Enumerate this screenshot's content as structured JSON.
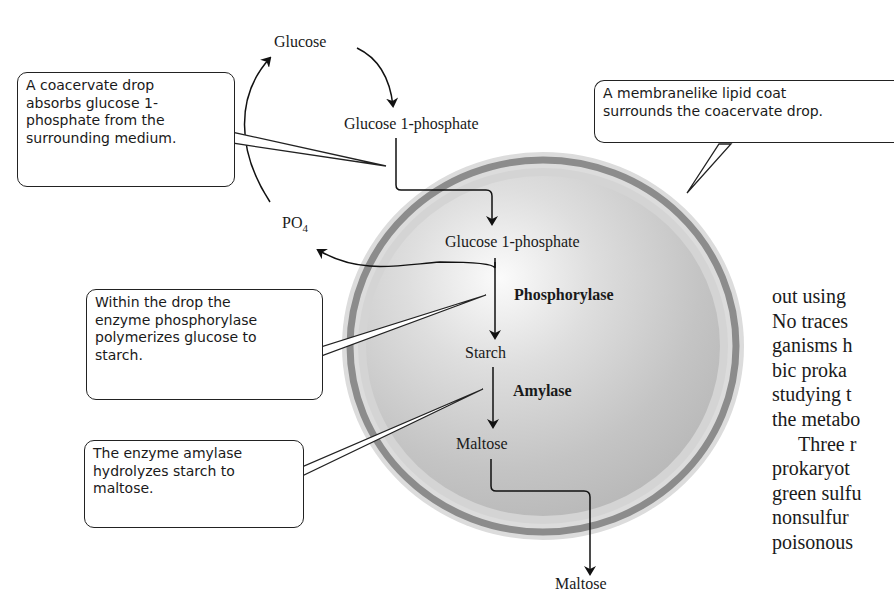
{
  "diagram": {
    "type": "coacervate-drop-metabolism",
    "outside_labels": {
      "glucose": "Glucose",
      "glucose1p_outside": "Glucose 1-phosphate",
      "po4_main": "PO",
      "po4_sub": "4",
      "maltose_outside": "Maltose"
    },
    "inside_labels": {
      "glucose1p_inside": "Glucose 1-phosphate",
      "phosphorylase": "Phosphorylase",
      "starch": "Starch",
      "amylase": "Amylase",
      "maltose_inside": "Maltose"
    },
    "callouts": {
      "absorb": [
        "A coacervate drop",
        "absorbs glucose 1-",
        "phosphate from the",
        "surrounding medium."
      ],
      "membrane": [
        "A membranelike lipid coat",
        "surrounds the coacervate drop."
      ],
      "phosphorylase": [
        "Within the drop the",
        "enzyme phosphorylase",
        "polymerizes glucose to",
        "starch."
      ],
      "amylase": [
        "The enzyme amylase",
        "hydrolyzes starch to",
        "maltose."
      ]
    },
    "colors": {
      "drop_fill": "#c9c9c9",
      "drop_highlight": "#f2f2f2",
      "membrane_band": "#8a8a8a",
      "outer_halo": "#d6d6d6",
      "arrow": "#111111"
    }
  },
  "body_text": {
    "lines": [
      "out using",
      "No traces",
      "ganisms h",
      "bic proka",
      "studying t",
      "the metabo",
      "Three  r",
      "prokaryot",
      "green sulfu",
      "nonsulfur",
      "poisonous"
    ]
  }
}
